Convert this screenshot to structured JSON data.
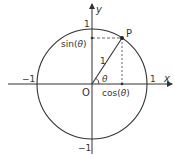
{
  "diagram": {
    "type": "unit-circle",
    "axes": {
      "x_label": "x",
      "y_label": "y"
    },
    "origin_label": "O",
    "point_label": "P",
    "radius_label": "1",
    "angle_label": "θ",
    "tick_labels": {
      "x_pos": "1",
      "x_neg": "−1",
      "y_pos": "1",
      "y_neg": "−1"
    },
    "projection_labels": {
      "sin": "sin(",
      "cos": "cos(",
      "theta": "θ",
      "close": ")"
    },
    "colors": {
      "line": "#333333",
      "dashed": "#555555",
      "background": "#ffffff"
    }
  }
}
